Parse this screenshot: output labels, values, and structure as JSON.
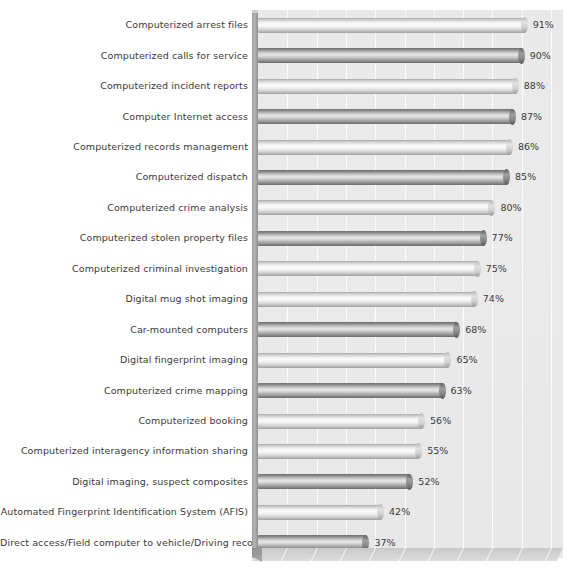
{
  "chart_data": {
    "type": "bar",
    "orientation": "horizontal",
    "title": "",
    "subtitle": "",
    "xlabel": "",
    "ylabel": "",
    "xlim": [
      0,
      100
    ],
    "grid": true,
    "legend": null,
    "value_suffix": "%",
    "categories": [
      "Computerized arrest files",
      "Computerized calls for service",
      "Computerized incident reports",
      "Computer Internet access",
      "Computerized records management",
      "Computerized dispatch",
      "Computerized crime analysis",
      "Computerized stolen property files",
      "Computerized criminal investigation",
      "Digital mug shot imaging",
      "Car-mounted computers",
      "Digital fingerprint imaging",
      "Computerized crime mapping",
      "Computerized booking",
      "Computerized interagency information sharing",
      "Digital imaging, suspect composites",
      "Automated Fingerprint Identification System (AFIS)",
      "Direct access/Field computer to vehicle/Driving records"
    ],
    "values": [
      91,
      90,
      88,
      87,
      86,
      85,
      80,
      77,
      75,
      74,
      68,
      65,
      63,
      56,
      55,
      52,
      42,
      37
    ],
    "value_labels": [
      "91%",
      "90%",
      "88%",
      "87%",
      "86%",
      "85%",
      "80%",
      "77%",
      "75%",
      "74%",
      "68%",
      "65%",
      "63%",
      "56%",
      "55%",
      "52%",
      "42%",
      "37%"
    ],
    "bar_shades": [
      "light",
      "dark",
      "light",
      "dark",
      "light",
      "dark",
      "light",
      "dark",
      "light",
      "light",
      "dark",
      "light",
      "dark",
      "light",
      "light",
      "dark",
      "light",
      "dark"
    ],
    "colors": {
      "bar_light": "#f2f2f2",
      "bar_dark": "#8d8d8d",
      "plot_background": "#e9e9e9",
      "floor": "#d4d4d4",
      "text": "#3a3a3a",
      "gridline": "#ffffff"
    }
  }
}
